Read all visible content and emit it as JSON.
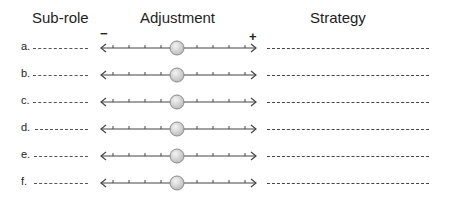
{
  "headers": {
    "subrole": "Sub-role",
    "adjustment": "Adjustment",
    "strategy": "Strategy"
  },
  "scale": {
    "minus": "−",
    "plus": "+",
    "ticks_per_side": 4,
    "knob_position": "center"
  },
  "rows": [
    {
      "label": "a.",
      "subrole_value": "",
      "strategy_value": ""
    },
    {
      "label": "b.",
      "subrole_value": "",
      "strategy_value": ""
    },
    {
      "label": "c.",
      "subrole_value": "",
      "strategy_value": ""
    },
    {
      "label": "d.",
      "subrole_value": "",
      "strategy_value": ""
    },
    {
      "label": "e.",
      "subrole_value": "",
      "strategy_value": ""
    },
    {
      "label": "f.",
      "subrole_value": "",
      "strategy_value": ""
    }
  ],
  "colors": {
    "line": "#444444",
    "knob_fill": "#d8d8d8",
    "knob_border": "#8a8a8a"
  }
}
